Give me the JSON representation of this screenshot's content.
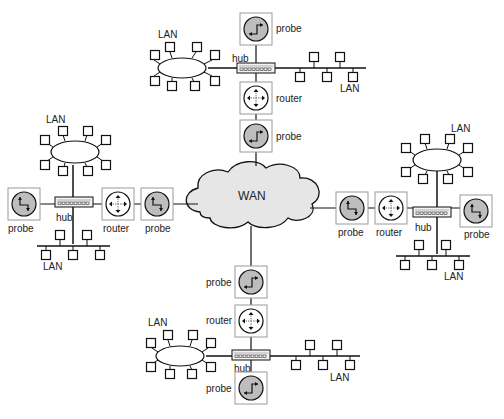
{
  "diagram": {
    "type": "network-topology",
    "center": {
      "label": "WAN",
      "shape": "cloud",
      "fill": "#e6e6e6"
    },
    "labels": {
      "lan": "LAN",
      "hub": "hub",
      "router": "router",
      "probe": "probe",
      "wan": "WAN"
    },
    "colors": {
      "line": "#111111",
      "probe_fill": "#bdbdbd",
      "device_box": "#9a9a9a",
      "cloud_fill": "#e6e6e6"
    },
    "branches": [
      {
        "position": "top",
        "chain": [
          "WAN",
          "probe",
          "router",
          "hub",
          "probe"
        ],
        "hub_lans": [
          "ring LAN (left)",
          "bus LAN (right)"
        ]
      },
      {
        "position": "left",
        "chain": [
          "WAN",
          "probe",
          "router",
          "hub",
          "probe"
        ],
        "hub_lans": [
          "ring LAN (top)",
          "bus LAN (bottom)"
        ]
      },
      {
        "position": "right",
        "chain": [
          "WAN",
          "probe",
          "router",
          "hub",
          "probe"
        ],
        "hub_lans": [
          "ring LAN (top)",
          "bus LAN (bottom)"
        ]
      },
      {
        "position": "bottom",
        "chain": [
          "WAN",
          "probe",
          "router",
          "hub",
          "probe"
        ],
        "hub_lans": [
          "ring LAN (left)",
          "bus LAN (right)"
        ]
      }
    ]
  }
}
